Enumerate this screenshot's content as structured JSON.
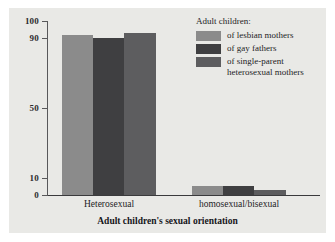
{
  "chart_data": {
    "type": "bar",
    "title": "",
    "subtitle": "",
    "xlabel": "Adult children's sexual orientation",
    "ylabel": "",
    "categories": [
      "Heterosexual",
      "homosexual/bisexual"
    ],
    "series": [
      {
        "name": "of lesbian mothers",
        "color": "#8b8b8b",
        "values": [
          92,
          5
        ]
      },
      {
        "name": "of gay fathers",
        "color": "#3f3f41",
        "values": [
          90,
          5
        ]
      },
      {
        "name": "of single-parent heterosexual mothers",
        "color": "#5d5d5f",
        "values": [
          93,
          3
        ]
      }
    ],
    "ylim": [
      0,
      100
    ],
    "yticks": [
      0,
      10,
      50,
      90,
      100
    ],
    "ytick_labels": [
      "0",
      "10",
      "50",
      "90",
      "100"
    ],
    "grid": false,
    "legend_position": "top-right",
    "legend_title": "Adult children:",
    "legend_entries": [
      {
        "label": "of lesbian mothers",
        "color": "#8b8b8b"
      },
      {
        "label": "of gay fathers",
        "color": "#3f3f41"
      },
      {
        "label": "of single-parent heterosexual mothers",
        "color": "#5d5d5f"
      }
    ],
    "colors": {
      "plot_background": "#e9e9e6",
      "page_background": "#ffffff",
      "axis": "#3a3a3c",
      "text": "#1d1d1f"
    }
  }
}
